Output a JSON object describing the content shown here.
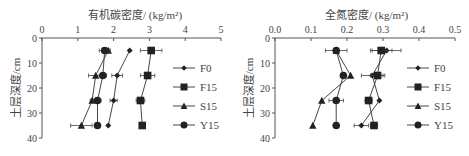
{
  "chart_data": [
    {
      "type": "line",
      "title": "有机碳密度/ (kg/m²)",
      "xlabel": "有机碳密度/ (kg/m²)",
      "ylabel": "土层深度/cm",
      "xlim": [
        0,
        5
      ],
      "ylim": [
        40,
        0
      ],
      "x_ticks": [
        "0",
        "1",
        "2",
        "3",
        "4",
        "5"
      ],
      "y_ticks": [
        "0",
        "10",
        "20",
        "30",
        "40"
      ],
      "depths": [
        5,
        15,
        25,
        35
      ],
      "legend_position": "right",
      "grid": false,
      "series": [
        {
          "name": "F0",
          "marker": "diamond",
          "values": [
            2.45,
            2.1,
            2.0,
            1.85
          ],
          "errors": [
            0.0,
            0.15,
            0.1,
            0.0
          ]
        },
        {
          "name": "F15",
          "marker": "square",
          "values": [
            3.05,
            2.95,
            2.75,
            2.8
          ],
          "errors": [
            0.3,
            0.2,
            0.12,
            0.05
          ]
        },
        {
          "name": "S15",
          "marker": "triangle",
          "values": [
            1.85,
            1.5,
            1.4,
            1.1
          ],
          "errors": [
            0.05,
            0.2,
            0.05,
            0.3
          ]
        },
        {
          "name": "Y15",
          "marker": "circle",
          "values": [
            1.75,
            1.7,
            1.55,
            1.55
          ],
          "errors": [
            0.15,
            0.1,
            0.1,
            0.05
          ]
        }
      ]
    },
    {
      "type": "line",
      "title": "全氮密度/ (kg/m²)",
      "xlabel": "全氮密度/ (kg/m²)",
      "ylabel": "土层深度/cm",
      "xlim": [
        0,
        0.5
      ],
      "ylim": [
        40,
        0
      ],
      "x_ticks": [
        "0.0",
        "0.1",
        "0.2",
        "0.3",
        "0.4",
        "0.5"
      ],
      "y_ticks": [
        "0",
        "10",
        "20",
        "30",
        "40"
      ],
      "depths": [
        5,
        15,
        25,
        35
      ],
      "legend_position": "right",
      "grid": false,
      "series": [
        {
          "name": "F0",
          "marker": "diamond",
          "values": [
            0.31,
            0.27,
            0.29,
            0.24
          ],
          "errors": [
            0.04,
            0.03,
            0.0,
            0.02
          ]
        },
        {
          "name": "F15",
          "marker": "square",
          "values": [
            0.295,
            0.285,
            0.26,
            0.275
          ],
          "errors": [
            0.03,
            0.02,
            0.01,
            0.01
          ]
        },
        {
          "name": "S15",
          "marker": "triangle",
          "values": [
            0.17,
            0.21,
            0.13,
            0.105
          ],
          "errors": [
            0.0,
            0.0,
            0.0,
            0.0
          ]
        },
        {
          "name": "Y15",
          "marker": "circle",
          "values": [
            0.17,
            0.19,
            0.17,
            0.17
          ],
          "errors": [
            0.03,
            0.0,
            0.02,
            0.0
          ]
        }
      ]
    }
  ],
  "left": {
    "title": "有机碳密度/ (kg/m²)",
    "ylabel": "土层深度/cm"
  },
  "right": {
    "title": "全氮密度/ (kg/m²)",
    "ylabel": "土层深度/cm"
  }
}
